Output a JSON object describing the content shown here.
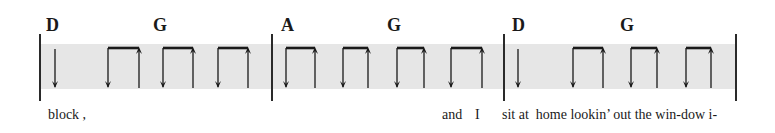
{
  "notation": {
    "type": "strum-pattern",
    "band_color": "#e6e6e6",
    "ink_color": "#1a1a1a",
    "measures": [
      {
        "index": 1,
        "chords": [
          {
            "label": "D",
            "x": 52
          },
          {
            "label": "G",
            "x": 158
          }
        ],
        "strums": [
          {
            "kind": "down",
            "x": 55
          },
          {
            "kind": "down-up",
            "down_x": 108,
            "up_x": 139
          },
          {
            "kind": "down-up",
            "down_x": 163,
            "up_x": 193
          },
          {
            "kind": "down-up",
            "down_x": 218,
            "up_x": 248
          }
        ]
      },
      {
        "index": 2,
        "chords": [
          {
            "label": "A",
            "x": 285
          },
          {
            "label": "G",
            "x": 392
          }
        ],
        "strums": [
          {
            "kind": "down-up",
            "down_x": 286,
            "up_x": 315
          },
          {
            "kind": "down-up",
            "down_x": 343,
            "up_x": 368
          },
          {
            "kind": "down-up",
            "down_x": 397,
            "up_x": 424
          },
          {
            "kind": "down-up",
            "down_x": 451,
            "up_x": 482
          }
        ]
      },
      {
        "index": 3,
        "chords": [
          {
            "label": "D",
            "x": 516
          },
          {
            "label": "G",
            "x": 624
          }
        ],
        "strums": [
          {
            "kind": "down",
            "x": 518
          },
          {
            "kind": "down-up",
            "down_x": 573,
            "up_x": 603
          },
          {
            "kind": "down-up",
            "down_x": 631,
            "up_x": 657
          },
          {
            "kind": "down-up",
            "down_x": 686,
            "up_x": 711
          }
        ]
      }
    ],
    "barlines_x": [
      40,
      272,
      504,
      736
    ],
    "lyrics": [
      {
        "text": "block ,",
        "x": 48
      },
      {
        "text": "and",
        "x": 442
      },
      {
        "text": "I",
        "x": 475
      },
      {
        "text": "sit at  home lookin’ out the win-dow i-",
        "x": 502
      }
    ]
  }
}
